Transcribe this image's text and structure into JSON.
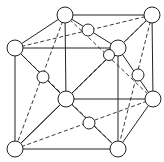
{
  "diagram": {
    "colors": {
      "line": "#222222",
      "atom_fill": "#ffffff",
      "background": "#ffffff"
    },
    "atoms": [
      {
        "id": "top-back-left",
        "x": 65,
        "y": 15,
        "r": 8,
        "kind": "corner"
      },
      {
        "id": "top-back-right",
        "x": 152,
        "y": 15,
        "r": 8,
        "kind": "corner"
      },
      {
        "id": "top-front-left",
        "x": 15,
        "y": 48,
        "r": 8,
        "kind": "corner"
      },
      {
        "id": "top-front-right",
        "x": 118,
        "y": 48,
        "r": 8,
        "kind": "corner"
      },
      {
        "id": "bottom-back-right",
        "x": 153,
        "y": 99,
        "r": 8,
        "kind": "corner"
      },
      {
        "id": "bottom-front-left",
        "x": 15,
        "y": 149,
        "r": 8,
        "kind": "corner"
      },
      {
        "id": "bottom-front-right",
        "x": 118,
        "y": 149,
        "r": 8,
        "kind": "corner"
      },
      {
        "id": "front-face-center",
        "x": 66,
        "y": 99,
        "r": 8,
        "kind": "face-center"
      },
      {
        "id": "top-face-center",
        "x": 88,
        "y": 30,
        "r": 6,
        "kind": "face-center"
      },
      {
        "id": "back-face-center",
        "x": 109,
        "y": 55,
        "r": 5.5,
        "kind": "face-center"
      },
      {
        "id": "left-face-center",
        "x": 43,
        "y": 77,
        "r": 6,
        "kind": "face-center"
      },
      {
        "id": "right-face-center",
        "x": 138,
        "y": 75,
        "r": 6,
        "kind": "face-center"
      },
      {
        "id": "bottom-face-center",
        "x": 89,
        "y": 123,
        "r": 6,
        "kind": "face-center"
      }
    ],
    "bonds": [
      {
        "from": [
          65,
          15
        ],
        "to": [
          152,
          15
        ],
        "style": "solid"
      },
      {
        "from": [
          15,
          48
        ],
        "to": [
          118,
          48
        ],
        "style": "solid"
      },
      {
        "from": [
          65,
          15
        ],
        "to": [
          15,
          48
        ],
        "style": "solid"
      },
      {
        "from": [
          152,
          15
        ],
        "to": [
          118,
          48
        ],
        "style": "solid"
      },
      {
        "from": [
          15,
          48
        ],
        "to": [
          15,
          149
        ],
        "style": "solid"
      },
      {
        "from": [
          118,
          48
        ],
        "to": [
          118,
          149
        ],
        "style": "solid"
      },
      {
        "from": [
          152,
          15
        ],
        "to": [
          153,
          99
        ],
        "style": "solid"
      },
      {
        "from": [
          65,
          15
        ],
        "to": [
          66,
          99
        ],
        "style": "solid"
      },
      {
        "from": [
          15,
          149
        ],
        "to": [
          118,
          149
        ],
        "style": "solid"
      },
      {
        "from": [
          66,
          99
        ],
        "to": [
          153,
          99
        ],
        "style": "solid"
      },
      {
        "from": [
          66,
          99
        ],
        "to": [
          15,
          149
        ],
        "style": "solid"
      },
      {
        "from": [
          153,
          99
        ],
        "to": [
          118,
          149
        ],
        "style": "solid"
      },
      {
        "from": [
          65,
          15
        ],
        "to": [
          118,
          48
        ],
        "style": "solid"
      },
      {
        "from": [
          15,
          48
        ],
        "to": [
          152,
          15
        ],
        "style": "dashed"
      },
      {
        "from": [
          65,
          15
        ],
        "to": [
          153,
          99
        ],
        "style": "dashed"
      },
      {
        "from": [
          152,
          15
        ],
        "to": [
          66,
          99
        ],
        "style": "dashed"
      },
      {
        "from": [
          15,
          48
        ],
        "to": [
          66,
          99
        ],
        "style": "solid"
      },
      {
        "from": [
          65,
          15
        ],
        "to": [
          15,
          149
        ],
        "style": "dashed"
      },
      {
        "from": [
          118,
          48
        ],
        "to": [
          153,
          99
        ],
        "style": "solid"
      },
      {
        "from": [
          152,
          15
        ],
        "to": [
          118,
          149
        ],
        "style": "dashed"
      },
      {
        "from": [
          15,
          149
        ],
        "to": [
          153,
          99
        ],
        "style": "dashed"
      },
      {
        "from": [
          66,
          99
        ],
        "to": [
          118,
          149
        ],
        "style": "solid"
      },
      {
        "from": [
          118,
          48
        ],
        "to": [
          15,
          149
        ],
        "style": "solid"
      },
      {
        "from": [
          15,
          48
        ],
        "to": [
          118,
          149
        ],
        "style": "dashed"
      },
      {
        "from": [
          66,
          99
        ],
        "to": [
          118,
          48
        ],
        "style": "dashed"
      }
    ]
  }
}
